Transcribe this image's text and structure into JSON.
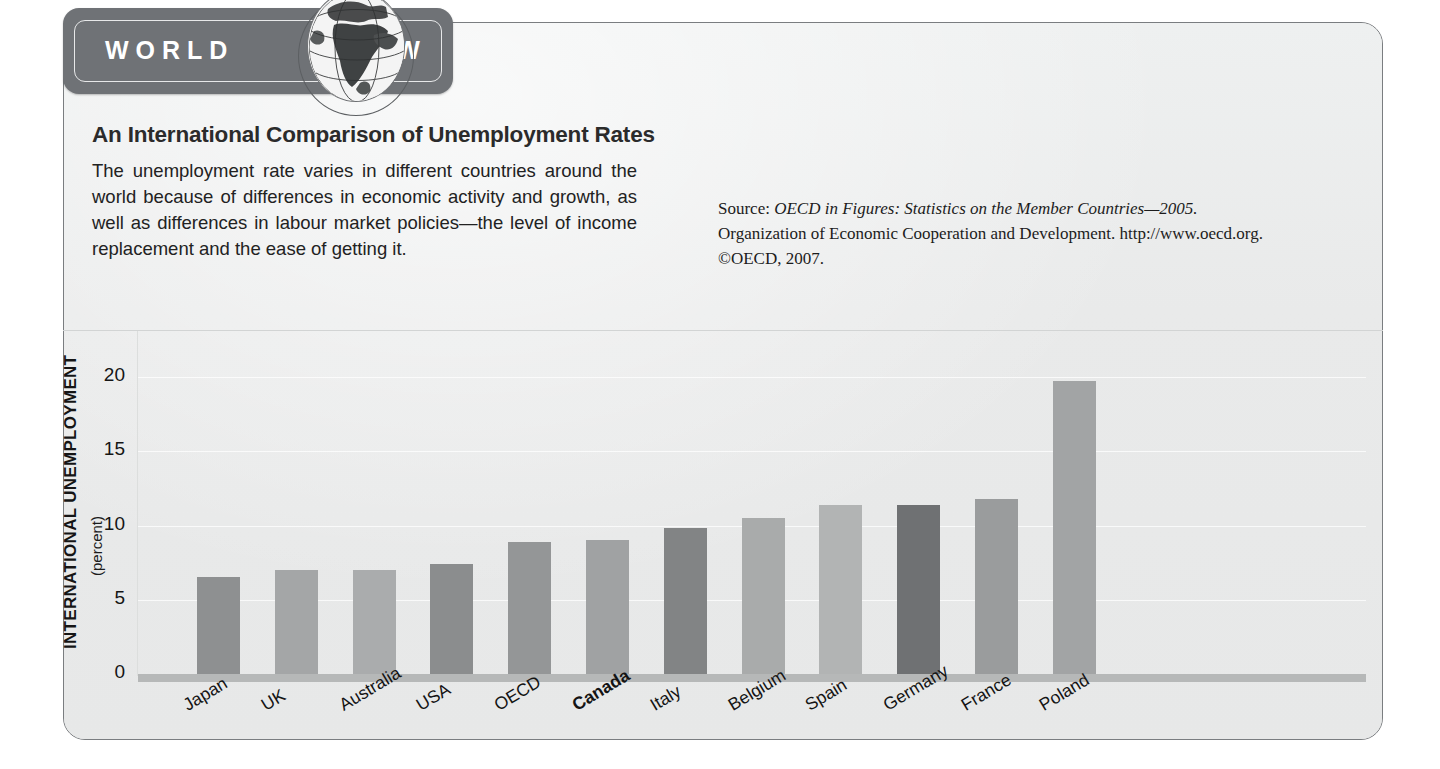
{
  "banner": {
    "word_left": "WORLD",
    "word_right": "VIEW",
    "globe_icon": "globe-icon",
    "background_color": "#6f7276"
  },
  "article": {
    "headline": "An International Comparison of Unemployment Rates",
    "intro": "The unemployment rate varies in different countries around the world because of differences in economic activity and growth, as well as differences in labour market policies—the level of income replacement and the ease of getting it.",
    "source": {
      "prefix": "Source: ",
      "title_italic": "OECD in Figures: Statistics on the Member Countries—2005.",
      "rest": " Organization of Economic Cooperation and Development. http://www.oecd.org. ©OECD, 2007."
    }
  },
  "chart_data": {
    "type": "bar",
    "title": "An International Comparison of Unemployment Rates",
    "xlabel": "",
    "ylabel": "INTERNATIONAL UNEMPLOYMENT",
    "ylabel_sub": "(percent)",
    "ylim": [
      0,
      21.5
    ],
    "yticks": [
      0,
      5,
      10,
      15,
      20
    ],
    "ytick_labels": [
      "0",
      "5",
      "10",
      "15",
      "20"
    ],
    "grid": true,
    "legend": "none",
    "highlight_category": "Canada",
    "categories": [
      "Japan",
      "UK",
      "Australia",
      "USA",
      "OECD",
      "Canada",
      "Italy",
      "Belgium",
      "Spain",
      "Germany",
      "France",
      "Poland"
    ],
    "values": [
      6.5,
      7.0,
      7.0,
      7.4,
      8.9,
      9.0,
      9.8,
      10.5,
      11.4,
      11.4,
      11.8,
      19.7
    ],
    "bar_colors": [
      "#8e9091",
      "#a4a6a7",
      "#aaacad",
      "#8b8d8e",
      "#949697",
      "#a0a2a3",
      "#828485",
      "#a9abab",
      "#b2b4b4",
      "#6f7173",
      "#9a9c9d",
      "#a2a4a5"
    ]
  }
}
